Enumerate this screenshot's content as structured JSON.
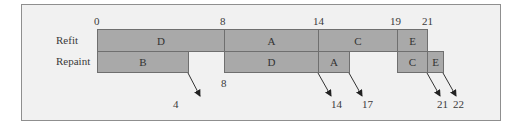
{
  "diagram": {
    "rows": [
      {
        "label": "Refit",
        "tasks": [
          {
            "name": "D",
            "start": 0,
            "end": 8
          },
          {
            "name": "A",
            "start": 8,
            "end": 14
          },
          {
            "name": "C",
            "start": 14,
            "end": 19
          },
          {
            "name": "E",
            "start": 19,
            "end": 21
          }
        ]
      },
      {
        "label": "Repaint",
        "tasks": [
          {
            "name": "B",
            "start": 0,
            "end": 4
          },
          {
            "name": "D",
            "start": 8,
            "end": 14
          },
          {
            "name": "A",
            "start": 14,
            "end": 17
          },
          {
            "name": "C",
            "start": 19,
            "end": 21
          },
          {
            "name": "E",
            "start": 21,
            "end": 22
          }
        ]
      }
    ],
    "top_ticks": [
      "0",
      "8",
      "14",
      "19",
      "21"
    ],
    "bottom_labels": [
      "8",
      "4",
      "14",
      "17",
      "21",
      "22"
    ],
    "colors": {
      "bar": "#a9a9a9",
      "border": "#6f6f6f",
      "background": "#f1f1f1"
    }
  }
}
